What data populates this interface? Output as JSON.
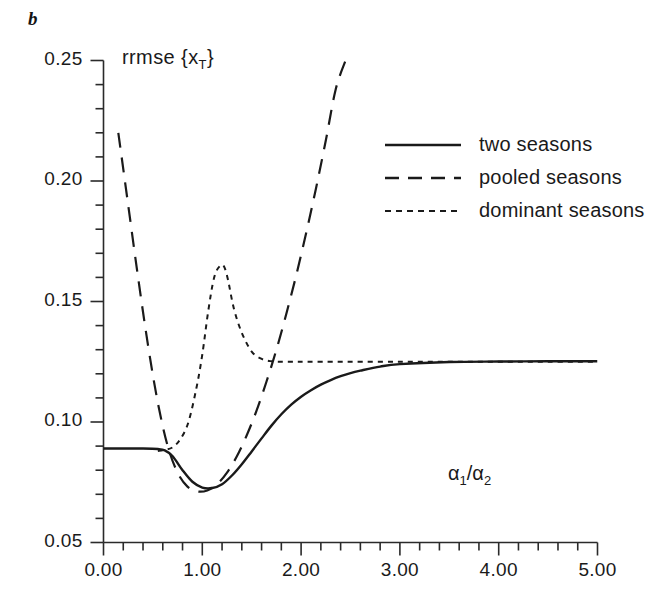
{
  "panel": {
    "label": "b"
  },
  "axes": {
    "y_title_prefix": "rrmse ",
    "y_title_open": "{",
    "y_title_var": "x",
    "y_title_sub": "T",
    "y_title_close": "}",
    "x_title_a": "α",
    "x_title_sub1": "1",
    "x_title_slash": "/",
    "x_title_b": "α",
    "x_title_sub2": "2"
  },
  "legend": {
    "items": [
      {
        "label": "two seasons",
        "style": "solid",
        "dash": "none"
      },
      {
        "label": "pooled seasons",
        "style": "dashed",
        "dash": "14,9"
      },
      {
        "label": "dominant seasons",
        "style": "dotted",
        "dash": "6,5"
      }
    ]
  },
  "chart_data": {
    "type": "line",
    "title": "",
    "xlabel": "alpha1/alpha2",
    "ylabel": "rrmse {x_T}",
    "xlim": [
      0.0,
      5.0
    ],
    "ylim": [
      0.05,
      0.25
    ],
    "grid": false,
    "legend_position": "upper-right",
    "xticks": [
      "0.00",
      "1.00",
      "2.00",
      "3.00",
      "4.00",
      "5.00"
    ],
    "xtick_values": [
      0.0,
      1.0,
      2.0,
      3.0,
      4.0,
      5.0
    ],
    "x_minor_step": 0.2,
    "yticks": [
      "0.05",
      "0.10",
      "0.15",
      "0.20",
      "0.25"
    ],
    "ytick_values": [
      0.05,
      0.1,
      0.15,
      0.2,
      0.25
    ],
    "y_minor_step": 0.01,
    "series": [
      {
        "name": "two seasons",
        "style": "solid",
        "color": "#1a1a1a",
        "x": [
          0.0,
          0.2,
          0.4,
          0.55,
          0.62,
          0.7,
          0.8,
          0.9,
          1.0,
          1.1,
          1.2,
          1.3,
          1.4,
          1.5,
          1.6,
          1.7,
          1.8,
          1.9,
          2.0,
          2.1,
          2.2,
          2.3,
          2.4,
          2.5,
          2.6,
          2.8,
          3.0,
          3.5,
          4.0,
          4.5,
          5.0
        ],
        "y": [
          0.089,
          0.089,
          0.089,
          0.0888,
          0.0882,
          0.0858,
          0.08,
          0.0752,
          0.0728,
          0.0726,
          0.0742,
          0.0778,
          0.0825,
          0.0878,
          0.0932,
          0.0985,
          0.1032,
          0.1072,
          0.1105,
          0.1132,
          0.1155,
          0.1174,
          0.119,
          0.1203,
          0.1213,
          0.123,
          0.124,
          0.1249,
          0.1251,
          0.1252,
          0.1252
        ]
      },
      {
        "name": "pooled seasons",
        "style": "dashed",
        "color": "#1a1a1a",
        "x": [
          0.15,
          0.25,
          0.35,
          0.45,
          0.55,
          0.65,
          0.75,
          0.85,
          0.95,
          1.05,
          1.15,
          1.25,
          1.35,
          1.45,
          1.55,
          1.65,
          1.75,
          1.85,
          1.95,
          2.05,
          2.15,
          2.25,
          2.35,
          2.45
        ],
        "y": [
          0.22,
          0.19,
          0.16,
          0.132,
          0.108,
          0.09,
          0.079,
          0.0732,
          0.0712,
          0.0716,
          0.0742,
          0.079,
          0.0858,
          0.0945,
          0.1048,
          0.1168,
          0.13,
          0.1448,
          0.1608,
          0.1782,
          0.1968,
          0.2168,
          0.238,
          0.25
        ]
      },
      {
        "name": "dominant seasons",
        "style": "dotted",
        "color": "#1a1a1a",
        "x": [
          0.55,
          0.62,
          0.7,
          0.78,
          0.86,
          0.94,
          1.0,
          1.06,
          1.12,
          1.18,
          1.22,
          1.26,
          1.32,
          1.4,
          1.5,
          1.6,
          1.7,
          1.8,
          1.9,
          2.0,
          2.2,
          2.5,
          3.0,
          3.5,
          4.0,
          4.5,
          5.0
        ],
        "y": [
          0.088,
          0.0884,
          0.0895,
          0.093,
          0.1,
          0.114,
          0.128,
          0.146,
          0.16,
          0.1648,
          0.1645,
          0.159,
          0.147,
          0.137,
          0.1292,
          0.1262,
          0.1252,
          0.125,
          0.125,
          0.125,
          0.125,
          0.125,
          0.125,
          0.125,
          0.125,
          0.125,
          0.125
        ]
      }
    ]
  }
}
